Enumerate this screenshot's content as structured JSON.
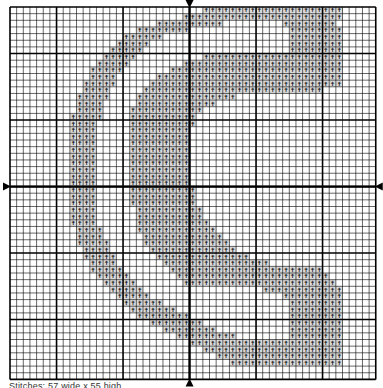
{
  "pattern": {
    "caption": "Stitches: 57 wide x 55 high",
    "grid": {
      "origin_x": 10,
      "origin_y": 7,
      "cell": 6.65,
      "cols": 55,
      "rows": 56,
      "major_every": 10,
      "major_offset_col": 7,
      "major_offset_row": 7,
      "center_col": 27,
      "center_row": 27,
      "line_color": "#000000",
      "fill_color": "#d9d9d9",
      "symbol_color": "#000000"
    },
    "symbol": "✝",
    "rows": [
      [
        [
          29,
          49
        ]
      ],
      [
        [
          26,
          49
        ]
      ],
      [
        [
          22,
          31
        ],
        [
          41,
          48
        ]
      ],
      [
        [
          19,
          26
        ],
        [
          42,
          49
        ]
      ],
      [
        [
          17,
          22
        ],
        [
          42,
          49
        ]
      ],
      [
        [
          16,
          20
        ],
        [
          42,
          49
        ]
      ],
      [
        [
          15,
          19
        ],
        [
          42,
          49
        ]
      ],
      [
        [
          14,
          18
        ],
        [
          29,
          49
        ]
      ],
      [
        [
          13,
          17
        ],
        [
          26,
          49
        ]
      ],
      [
        [
          12,
          16
        ],
        [
          24,
          49
        ]
      ],
      [
        [
          12,
          15
        ],
        [
          22,
          49
        ]
      ],
      [
        [
          11,
          15
        ],
        [
          21,
          49
        ]
      ],
      [
        [
          11,
          14
        ],
        [
          20,
          46
        ]
      ],
      [
        [
          10,
          14
        ],
        [
          19,
          33
        ]
      ],
      [
        [
          10,
          13
        ],
        [
          19,
          30
        ]
      ],
      [
        [
          10,
          13
        ],
        [
          18,
          28
        ]
      ],
      [
        [
          9,
          13
        ],
        [
          18,
          27
        ]
      ],
      [
        [
          9,
          12
        ],
        [
          18,
          27
        ]
      ],
      [
        [
          9,
          12
        ],
        [
          18,
          26
        ]
      ],
      [
        [
          9,
          12
        ],
        [
          18,
          26
        ]
      ],
      [
        [
          9,
          12
        ],
        [
          18,
          26
        ]
      ],
      [
        [
          9,
          12
        ],
        [
          18,
          26
        ]
      ],
      [
        [
          9,
          12
        ],
        [
          18,
          26
        ]
      ],
      [
        [
          9,
          12
        ],
        [
          18,
          26
        ]
      ],
      [
        [
          9,
          12
        ],
        [
          18,
          26
        ]
      ],
      [
        [
          9,
          12
        ],
        [
          18,
          26
        ]
      ],
      [
        [
          9,
          12
        ],
        [
          18,
          26
        ]
      ],
      [
        [
          9,
          12
        ],
        [
          18,
          27
        ]
      ],
      [
        [
          9,
          12
        ],
        [
          18,
          27
        ]
      ],
      [
        [
          9,
          12
        ],
        [
          18,
          27
        ]
      ],
      [
        [
          9,
          12
        ],
        [
          19,
          28
        ]
      ],
      [
        [
          9,
          12
        ],
        [
          19,
          28
        ]
      ],
      [
        [
          9,
          12
        ],
        [
          19,
          29
        ]
      ],
      [
        [
          10,
          13
        ],
        [
          19,
          30
        ]
      ],
      [
        [
          10,
          13
        ],
        [
          20,
          31
        ]
      ],
      [
        [
          10,
          14
        ],
        [
          20,
          32
        ]
      ],
      [
        [
          11,
          14
        ],
        [
          21,
          33
        ]
      ],
      [
        [
          11,
          15
        ],
        [
          22,
          35
        ]
      ],
      [
        [
          12,
          15
        ],
        [
          23,
          38
        ]
      ],
      [
        [
          12,
          16
        ],
        [
          24,
          46
        ]
      ],
      [
        [
          13,
          17
        ],
        [
          25,
          47
        ]
      ],
      [
        [
          14,
          18
        ],
        [
          26,
          48
        ]
      ],
      [
        [
          15,
          19
        ],
        [
          38,
          49
        ]
      ],
      [
        [
          16,
          20
        ],
        [
          41,
          49
        ]
      ],
      [
        [
          17,
          22
        ],
        [
          42,
          49
        ]
      ],
      [
        [
          18,
          24
        ],
        [
          42,
          49
        ]
      ],
      [
        [
          19,
          26
        ],
        [
          42,
          49
        ]
      ],
      [
        [
          21,
          28
        ],
        [
          42,
          49
        ]
      ],
      [
        [
          23,
          30
        ],
        [
          42,
          49
        ]
      ],
      [
        [
          25,
          33
        ],
        [
          42,
          49
        ]
      ],
      [
        [
          27,
          49
        ]
      ],
      [
        [
          29,
          49
        ]
      ],
      [
        [
          31,
          49
        ]
      ],
      [
        [
          33,
          49
        ]
      ],
      [],
      []
    ]
  }
}
